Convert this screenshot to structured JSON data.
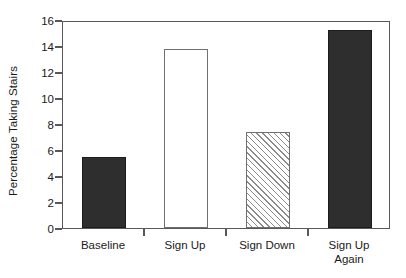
{
  "chart_data": {
    "type": "bar",
    "title": "",
    "subtitle": "",
    "xlabel": "",
    "ylabel": "Percentage Taking Stairs",
    "categories": [
      "Baseline",
      "Sign Up",
      "Sign Down",
      "Sign Up\nAgain"
    ],
    "values": [
      5.5,
      13.8,
      7.4,
      15.2
    ],
    "bar_styles": [
      "solid-black",
      "open-white",
      "diagonal-hatch",
      "solid-black"
    ],
    "ylim": [
      0,
      16
    ],
    "yticks": [
      0,
      2,
      4,
      6,
      8,
      10,
      12,
      14,
      16
    ],
    "ytick_labels": [
      "0",
      "2",
      "4",
      "6",
      "8",
      "10",
      "12",
      "14",
      "16"
    ],
    "xlim_categories": 4,
    "grid": false,
    "legend": null,
    "frame": "box",
    "colors": {
      "bar_solid": "#2e2e2e",
      "bar_open_fill": "#ffffff",
      "bar_outline": "#6f7072",
      "hatch_line": "#8a8b8d",
      "axis": "#58595b",
      "text": "#1a1a1a",
      "background": "#ffffff"
    }
  },
  "axis": {
    "y_title": "Percentage Taking Stairs",
    "y_ticks": [
      {
        "label": "16",
        "value": 16
      },
      {
        "label": "14",
        "value": 14
      },
      {
        "label": "12",
        "value": 12
      },
      {
        "label": "10",
        "value": 10
      },
      {
        "label": "8",
        "value": 8
      },
      {
        "label": "6",
        "value": 6
      },
      {
        "label": "4",
        "value": 4
      },
      {
        "label": "2",
        "value": 2
      },
      {
        "label": "0",
        "value": 0
      }
    ]
  },
  "series": [
    {
      "category": "Baseline",
      "label": "Baseline",
      "value": 5.5,
      "style": "solid-black"
    },
    {
      "category": "Sign Up",
      "label": "Sign Up",
      "value": 13.8,
      "style": "open-white"
    },
    {
      "category": "Sign Down",
      "label": "Sign Down",
      "value": 7.4,
      "style": "diagonal-hatch"
    },
    {
      "category": "Sign Up Again",
      "label": "Sign Up\nAgain",
      "value": 15.2,
      "style": "solid-black"
    }
  ]
}
